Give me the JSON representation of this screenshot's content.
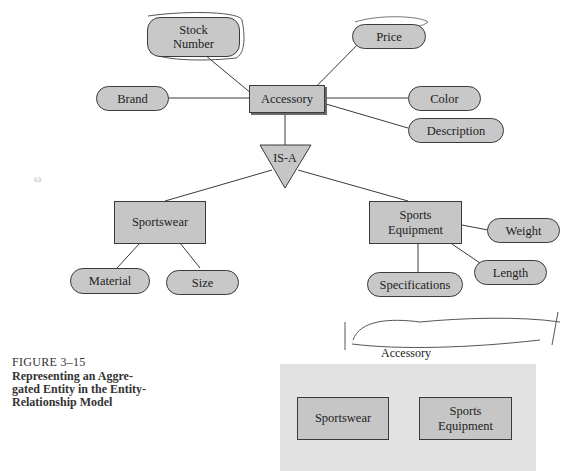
{
  "diagram": {
    "type": "entity-relationship",
    "entities": [
      {
        "id": "accessory",
        "label": "Accessory",
        "kind": "entity"
      },
      {
        "id": "sportswear",
        "label": "Sportswear",
        "kind": "entity"
      },
      {
        "id": "sports_equipment",
        "label": "Sports\nEquipment",
        "line1": "Sports",
        "line2": "Equipment",
        "kind": "entity"
      }
    ],
    "attributes": {
      "stock_number": {
        "line1": "Stock",
        "line2": "Number",
        "of": "accessory"
      },
      "price": {
        "label": "Price",
        "of": "accessory"
      },
      "brand": {
        "label": "Brand",
        "of": "accessory"
      },
      "color": {
        "label": "Color",
        "of": "accessory"
      },
      "description": {
        "label": "Description",
        "of": "accessory"
      },
      "material": {
        "label": "Material",
        "of": "sportswear"
      },
      "size": {
        "label": "Size",
        "of": "sportswear"
      },
      "weight": {
        "label": "Weight",
        "of": "sports_equipment"
      },
      "length": {
        "label": "Length",
        "of": "sports_equipment"
      },
      "specifications": {
        "label": "Specifications",
        "of": "sports_equipment"
      }
    },
    "isa": {
      "label": "IS-A",
      "parent": "accessory",
      "children": [
        "sportswear",
        "sports_equipment"
      ]
    }
  },
  "aggregate": {
    "label": "Accessory",
    "members": [
      {
        "line1": "Sportswear"
      },
      {
        "line1": "Sports",
        "line2": "Equipment"
      }
    ]
  },
  "caption": {
    "figure": "FIGURE 3–15",
    "title_lines": [
      "Representing an Aggre-",
      "gated Entity in the Entity-",
      "Relationship Model"
    ]
  },
  "annotations": {
    "signature": "Angela B Ray"
  },
  "colors": {
    "shape_fill": "#c6c6c6",
    "aggregate_fill": "#e2e2e2",
    "stroke": "#3a3a3a"
  }
}
